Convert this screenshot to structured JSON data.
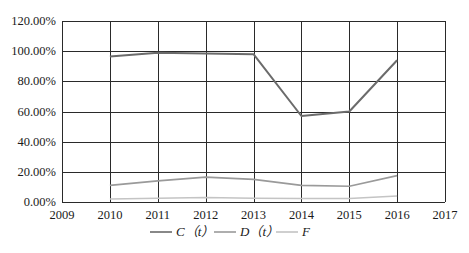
{
  "chart_data": {
    "type": "line",
    "title": "",
    "xlabel": "",
    "ylabel": "",
    "x_ticks": [
      "2009",
      "2010",
      "2011",
      "2012",
      "2013",
      "2014",
      "2015",
      "2016",
      "2017"
    ],
    "y_ticks": [
      "0.00%",
      "20.00%",
      "40.00%",
      "60.00%",
      "80.00%",
      "100.00%",
      "120.00%"
    ],
    "xlim": [
      2009,
      2017
    ],
    "ylim": [
      0,
      120
    ],
    "grid": true,
    "legend_position": "bottom",
    "x": [
      2010,
      2011,
      2012,
      2013,
      2014,
      2015,
      2016
    ],
    "series": [
      {
        "name": "C（t）",
        "color": "#6b6b6b",
        "values": [
          96.5,
          99.0,
          98.5,
          98.0,
          57.0,
          60.0,
          94.0
        ]
      },
      {
        "name": "D（t）",
        "color": "#9a9a9a",
        "values": [
          11.0,
          14.0,
          16.5,
          15.0,
          11.0,
          10.5,
          17.5
        ]
      },
      {
        "name": "F",
        "color": "#c4c4c4",
        "values": [
          2.0,
          2.5,
          3.0,
          2.5,
          2.3,
          2.3,
          4.0
        ]
      }
    ]
  },
  "legend": {
    "items": [
      {
        "label": "C（t）",
        "color": "#6b6b6b"
      },
      {
        "label": "D（t）",
        "color": "#9a9a9a"
      },
      {
        "label": "F",
        "color": "#c4c4c4"
      }
    ]
  },
  "style": {
    "grid_color": "#2a2a2a",
    "frame_color": "#2a2a2a"
  }
}
